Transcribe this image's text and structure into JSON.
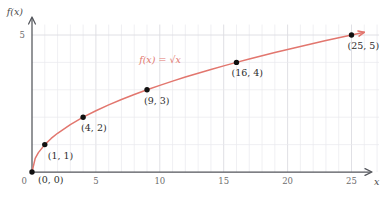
{
  "chart_data": {
    "type": "line",
    "title": "",
    "subtitle": "",
    "function_label": "f(x) = √x",
    "xlabel": "x",
    "ylabel": "f(x)",
    "xlim": [
      0,
      27
    ],
    "ylim": [
      0,
      5.6
    ],
    "grid": true,
    "grid_x_step": 1,
    "grid_y_step": 1,
    "legend": "none",
    "x_ticks": [
      {
        "value": 0,
        "label": "0"
      },
      {
        "value": 5,
        "label": "5"
      },
      {
        "value": 10,
        "label": "10"
      },
      {
        "value": 15,
        "label": "15"
      },
      {
        "value": 20,
        "label": "20"
      },
      {
        "value": 25,
        "label": "25"
      }
    ],
    "y_ticks": [
      {
        "value": 5,
        "label": "5"
      }
    ],
    "series": [
      {
        "name": "f(x) = √x",
        "color": "#e2766e",
        "x": [
          0,
          0.25,
          0.5,
          1,
          1.5,
          2,
          3,
          4,
          5,
          6,
          7,
          8,
          9,
          10,
          11,
          12,
          13,
          14,
          15,
          16,
          17,
          18,
          19,
          20,
          21,
          22,
          23,
          24,
          25,
          26
        ],
        "y": [
          0,
          0.5,
          0.707,
          1,
          1.225,
          1.414,
          1.732,
          2,
          2.236,
          2.449,
          2.646,
          2.828,
          3,
          3.162,
          3.317,
          3.464,
          3.606,
          3.742,
          3.873,
          4,
          4.123,
          4.243,
          4.359,
          4.472,
          4.583,
          4.69,
          4.796,
          4.899,
          5,
          5.099
        ]
      }
    ],
    "points": [
      {
        "x": 0,
        "y": 0,
        "label": "(0, 0)",
        "label_dx": 6,
        "label_dy": 11
      },
      {
        "x": 1,
        "y": 1,
        "label": "(1, 1)",
        "label_dx": 3,
        "label_dy": 14
      },
      {
        "x": 4,
        "y": 2,
        "label": "(4, 2)",
        "label_dx": -2,
        "label_dy": 14
      },
      {
        "x": 9,
        "y": 3,
        "label": "(9, 3)",
        "label_dx": -3,
        "label_dy": 14
      },
      {
        "x": 16,
        "y": 4,
        "label": "(16, 4)",
        "label_dx": -5,
        "label_dy": 14
      },
      {
        "x": 25,
        "y": 5,
        "label": "(25, 5)",
        "label_dx": -4,
        "label_dy": 14
      }
    ],
    "annotations": [
      {
        "text": "f(x) = √x",
        "x_px": 160,
        "y_px": 63
      }
    ],
    "colors": {
      "curve": "#e2766e",
      "axis": "#53555b",
      "grid": "#e9eaee",
      "point": "#111111",
      "text": "#2e2e2e",
      "tick_text": "#6e6e6e",
      "background": "#ffffff"
    }
  }
}
